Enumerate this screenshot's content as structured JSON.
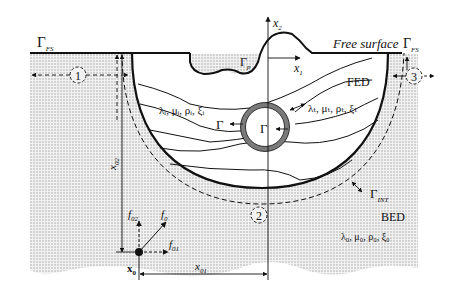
{
  "figure": {
    "width": 456,
    "height": 308,
    "colors": {
      "background": "#ffffff",
      "ink": "#111111",
      "bed_fill": "#e4e4e4",
      "inclusion_ring": "#7a7a7a"
    },
    "labels": {
      "gamma_fs_left": {
        "main": "Γ",
        "sub": "FS"
      },
      "free_surface": {
        "text": "Free surface",
        "main": "Γ",
        "sub": "FS"
      },
      "x2_axis": {
        "main": "x",
        "sub": "2"
      },
      "x1_axis": {
        "main": "x",
        "sub": "1"
      },
      "gamma_p": {
        "main": "Γ",
        "sub": "p"
      },
      "fed": "FED",
      "bed": "BED",
      "layer_params_i": "λᵢ, μᵢ, ρᵢ, ξᵢ",
      "inclusion_params_t": "λₜ, μₜ, ρₜ, ξₜ",
      "gamma_inner_left": "Γ",
      "gamma_inner_center": "Γ",
      "gamma_int": {
        "main": "Γ",
        "sub": "INT"
      },
      "bed_params": "λ₀, μ₀, ρ₀, ξ₀",
      "x02": {
        "main": "x",
        "sub": "02"
      },
      "x01": {
        "main": "x",
        "sub": "01"
      },
      "f02": {
        "main": "f",
        "sub": "02"
      },
      "f0": {
        "main": "f",
        "sub": "0"
      },
      "f01": {
        "main": "f",
        "sub": "01"
      },
      "x0": {
        "main": "x",
        "sub": "0"
      }
    },
    "regions": [
      {
        "id": "1",
        "label": "1"
      },
      {
        "id": "2",
        "label": "2"
      },
      {
        "id": "3",
        "label": "3"
      }
    ]
  }
}
